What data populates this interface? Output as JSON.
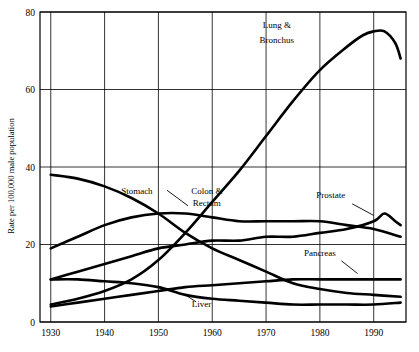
{
  "chart_data": {
    "type": "line",
    "title": "",
    "subtitle": "",
    "xlabel": "",
    "ylabel": "Rate per 100,000 male population",
    "xlim": [
      1928,
      1996
    ],
    "ylim": [
      0,
      80
    ],
    "xticks": [
      "1930",
      "1940",
      "1950",
      "1960",
      "1970",
      "1980",
      "1990"
    ],
    "yticks": [
      "0",
      "20",
      "40",
      "60",
      "80"
    ],
    "grid": true,
    "legend_position": "inline-annotations",
    "annotations": [
      {
        "label": "Lung &",
        "x": 1972,
        "y": 76
      },
      {
        "label": "Bronchus",
        "x": 1972,
        "y": 72
      },
      {
        "label": "Stomach",
        "x": 1946,
        "y": 33
      },
      {
        "label": "Colon &",
        "x": 1959,
        "y": 33
      },
      {
        "label": "Rectum",
        "x": 1959,
        "y": 30
      },
      {
        "label": "Prostate",
        "x": 1982,
        "y": 32
      },
      {
        "label": "Pancreas",
        "x": 1980,
        "y": 17
      },
      {
        "label": "Liver",
        "x": 1958,
        "y": 4
      }
    ],
    "series": [
      {
        "name": "Lung & Bronchus",
        "x": [
          1930,
          1935,
          1940,
          1945,
          1950,
          1955,
          1960,
          1965,
          1970,
          1975,
          1980,
          1985,
          1988,
          1990,
          1992,
          1994,
          1995
        ],
        "values": [
          4.5,
          6,
          8,
          11,
          16,
          23,
          31,
          39,
          48,
          57,
          65,
          71,
          74,
          75,
          75,
          72,
          68
        ]
      },
      {
        "name": "Stomach",
        "x": [
          1930,
          1935,
          1940,
          1945,
          1950,
          1955,
          1960,
          1965,
          1970,
          1975,
          1980,
          1985,
          1990,
          1995
        ],
        "values": [
          38,
          37,
          35,
          32,
          28,
          23,
          19,
          16,
          13,
          10,
          8.5,
          7.5,
          7,
          6.5
        ]
      },
      {
        "name": "Colon & Rectum",
        "x": [
          1930,
          1935,
          1940,
          1945,
          1950,
          1955,
          1960,
          1965,
          1970,
          1975,
          1980,
          1985,
          1990,
          1995
        ],
        "values": [
          19,
          22,
          25,
          27,
          28,
          28,
          27,
          26,
          26,
          26,
          26,
          25,
          24,
          22
        ]
      },
      {
        "name": "Prostate",
        "x": [
          1930,
          1935,
          1940,
          1945,
          1950,
          1955,
          1960,
          1965,
          1970,
          1975,
          1980,
          1985,
          1990,
          1992,
          1994,
          1995
        ],
        "values": [
          11,
          13,
          15,
          17,
          19,
          20,
          21,
          21,
          22,
          22,
          23,
          24,
          26,
          28,
          26,
          25
        ]
      },
      {
        "name": "Pancreas",
        "x": [
          1930,
          1935,
          1940,
          1945,
          1950,
          1955,
          1960,
          1965,
          1970,
          1975,
          1980,
          1985,
          1990,
          1995
        ],
        "values": [
          4,
          5,
          6,
          7,
          8,
          9,
          9.5,
          10,
          10.5,
          11,
          11,
          11,
          11,
          11
        ]
      },
      {
        "name": "Liver",
        "x": [
          1930,
          1935,
          1940,
          1945,
          1950,
          1955,
          1960,
          1965,
          1970,
          1975,
          1980,
          1985,
          1990,
          1995
        ],
        "values": [
          11,
          11,
          10.5,
          10,
          9,
          7,
          6,
          5.5,
          5,
          4.5,
          4.5,
          4.5,
          4.5,
          5
        ]
      }
    ]
  }
}
